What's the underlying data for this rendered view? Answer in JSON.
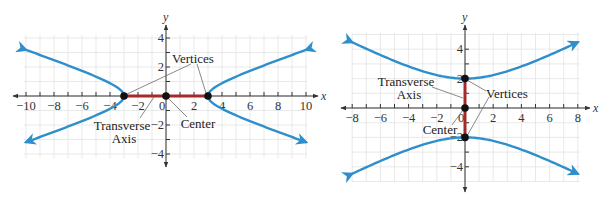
{
  "colors": {
    "curve": "#2e8fcb",
    "transverse_axis": "#a52a2a",
    "point": "#111111",
    "grid": "#e3e3e3",
    "axis": "#333333"
  },
  "chart_data": [
    {
      "type": "diagram",
      "title": "Hyperbola with horizontal transverse axis",
      "equation_hint": "x^2/9 - y^2/1 = 1",
      "orientation": "horizontal",
      "a": 3,
      "b": 1,
      "xlabel": "x",
      "ylabel": "y",
      "xlim": [
        -10,
        10
      ],
      "ylim": [
        -4,
        4
      ],
      "x_ticks": [
        -10,
        -8,
        -6,
        -4,
        -2,
        0,
        2,
        4,
        6,
        8,
        10
      ],
      "x_tick_labels": [
        "−10",
        "−8",
        "−6",
        "−4",
        "−2",
        "0",
        "2",
        "4",
        "6",
        "8",
        "10"
      ],
      "y_tick_labels": [
        {
          "value": 4,
          "label": "4"
        },
        {
          "value": 2,
          "label": "2"
        },
        {
          "value": -2,
          "label": "−2"
        },
        {
          "value": -4,
          "label": "−4"
        }
      ],
      "grid": true,
      "points": {
        "vertices": [
          [
            -3,
            0
          ],
          [
            3,
            0
          ]
        ],
        "center": [
          0,
          0
        ]
      },
      "transverse_axis": [
        [
          -3,
          0
        ],
        [
          3,
          0
        ]
      ],
      "annotations": {
        "vertices": "Vertices",
        "transverse_line1": "Transverse",
        "transverse_line2": "Axis",
        "center": "Center"
      },
      "layout": {
        "origin_px": [
          166,
          96
        ],
        "sx": 14,
        "sy": 14.5,
        "grid_box": [
          24,
          35,
          307,
          158
        ],
        "x_axis_px": [
          13,
          318
        ],
        "y_axis_px": [
          25,
          167
        ],
        "curve_x_max": 10
      }
    },
    {
      "type": "diagram",
      "title": "Hyperbola with vertical transverse axis",
      "equation_hint": "y^2/4 - x^2/16 = 1",
      "orientation": "vertical",
      "a": 2,
      "b": 4,
      "xlabel": "x",
      "ylabel": "y",
      "xlim": [
        -8,
        8
      ],
      "ylim": [
        -5,
        5
      ],
      "x_ticks": [
        -8,
        -6,
        -4,
        -2,
        0,
        2,
        4,
        6,
        8
      ],
      "x_tick_labels": [
        "−8",
        "−6",
        "−4",
        "−2",
        "0",
        "2",
        "4",
        "6",
        "8"
      ],
      "y_tick_labels": [
        {
          "value": 4,
          "label": "4"
        },
        {
          "value": 2,
          "label": "2"
        },
        {
          "value": -2,
          "label": "−2"
        },
        {
          "value": -4,
          "label": "−4"
        }
      ],
      "grid": true,
      "points": {
        "vertices": [
          [
            0,
            2
          ],
          [
            0,
            -2
          ]
        ],
        "center": [
          0,
          0
        ]
      },
      "transverse_axis": [
        [
          0,
          -2
        ],
        [
          0,
          2
        ]
      ],
      "annotations": {
        "vertices": "Vertices",
        "transverse_line1": "Transverse",
        "transverse_line2": "Axis",
        "center": "Center"
      },
      "layout": {
        "origin_px": [
          465,
          108
        ],
        "sx": 14.1,
        "sy": 14.7,
        "grid_box": [
          352,
          33,
          580,
          182
        ],
        "x_axis_px": [
          341,
          590
        ],
        "y_axis_px": [
          25,
          192
        ],
        "curve_x_max": 8
      }
    }
  ]
}
